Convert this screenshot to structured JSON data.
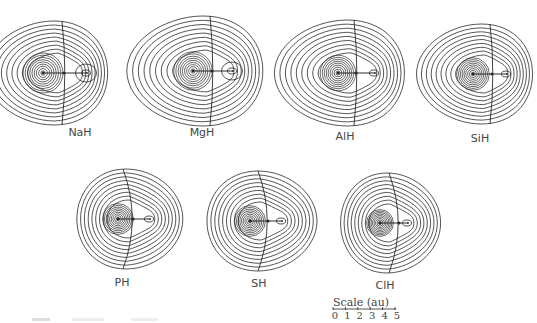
{
  "figure": {
    "type": "contour-plots",
    "molecules": [
      {
        "name": "NaH",
        "heavy": [
          43,
          73
        ],
        "h": [
          87,
          73
        ],
        "label_pos": [
          80,
          126
        ],
        "outer_rx": 61,
        "outer_ry": 52,
        "surface_x": 64,
        "h_contours": 2
      },
      {
        "name": "MgH",
        "heavy": [
          193,
          71
        ],
        "h": [
          233,
          71
        ],
        "label_pos": [
          202,
          126
        ],
        "outer_rx": 68,
        "outer_ry": 55,
        "surface_x": 212,
        "h_contours": 2
      },
      {
        "name": "AlH",
        "heavy": [
          338,
          73
        ],
        "h": [
          375,
          73
        ],
        "label_pos": [
          345,
          130
        ],
        "outer_rx": 65,
        "outer_ry": 53,
        "surface_x": 356,
        "h_contours": 1
      },
      {
        "name": "SiH",
        "heavy": [
          473,
          74
        ],
        "h": [
          507,
          74
        ],
        "label_pos": [
          480,
          132
        ],
        "outer_rx": 58,
        "outer_ry": 50,
        "surface_x": 492,
        "h_contours": 1
      },
      {
        "name": "PH",
        "heavy": [
          118,
          219
        ],
        "h": [
          150,
          219
        ],
        "label_pos": [
          122,
          276
        ],
        "outer_rx": 53,
        "outer_ry": 50,
        "surface_x": 133,
        "h_contours": 1
      },
      {
        "name": "SH",
        "heavy": [
          250,
          221
        ],
        "h": [
          282,
          221
        ],
        "label_pos": [
          259,
          277
        ],
        "outer_rx": 55,
        "outer_ry": 50,
        "surface_x": 268,
        "h_contours": 1
      },
      {
        "name": "ClH",
        "heavy": [
          380,
          223
        ],
        "h": [
          408,
          223
        ],
        "label_pos": [
          385,
          279
        ],
        "outer_rx": 50,
        "outer_ry": 50,
        "surface_x": 399,
        "h_contours": 1
      }
    ]
  },
  "labels": [
    "NaH",
    "MgH",
    "AlH",
    "SiH",
    "PH",
    "SH",
    "ClH"
  ],
  "scale": {
    "title": "Scale (au)",
    "ticks": [
      "0",
      "1",
      "2",
      "3",
      "4",
      "5"
    ],
    "x_start": 333,
    "x_end": 395,
    "y": 309
  },
  "colors": {
    "line": "#2a2a2a",
    "background": "#ffffff",
    "text": "#444444"
  }
}
